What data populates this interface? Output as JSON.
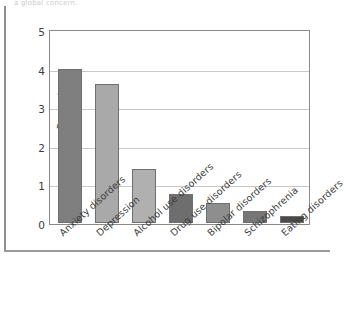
{
  "caption_sliver": "a global concern.",
  "chart_data": {
    "type": "bar",
    "title": "",
    "subtitle": "",
    "xlabel": "",
    "ylabel": "Percent",
    "ylim": [
      0,
      5
    ],
    "yticks": [
      "0",
      "1",
      "2",
      "3",
      "4",
      "5"
    ],
    "grid": true,
    "legend": "none",
    "categories": [
      "Anxiety disorders",
      "Depression",
      "Alcohol use disorders",
      "Drug use disorders",
      "Bipolar disorders",
      "Schizophrenia",
      "Eating disorders"
    ],
    "values": [
      3.98,
      3.6,
      1.41,
      0.74,
      0.52,
      0.3,
      0.18
    ],
    "bar_colors": [
      "#7f7f7f",
      "#a9a9a9",
      "#b0b0b0",
      "#6e6e6e",
      "#8e8e8e",
      "#767676",
      "#4a4a4a"
    ],
    "bar_edge_color": "#6f6f6f",
    "axis_color": "#8a8a8a",
    "gridline_color": "#c9c9c9",
    "background": "#ffffff"
  }
}
